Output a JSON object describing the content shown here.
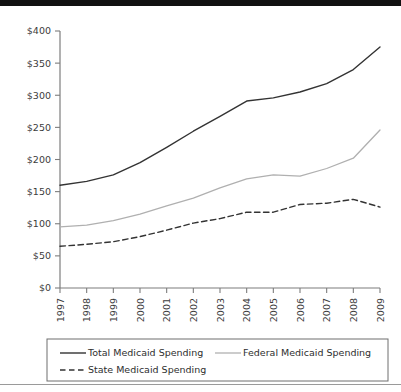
{
  "page": {
    "top_band_color": "#111111",
    "background_color": "#ffffff",
    "rule_color": "#9a9a9a"
  },
  "chart_data": {
    "type": "line",
    "title": "",
    "subtitle": "",
    "xlabel": "",
    "ylabel": "",
    "categories": [
      "1997",
      "1998",
      "1999",
      "2000",
      "2001",
      "2002",
      "2003",
      "2004",
      "2005",
      "2006",
      "2007",
      "2008",
      "2009"
    ],
    "x": [
      1997,
      1998,
      1999,
      2000,
      2001,
      2002,
      2003,
      2004,
      2005,
      2006,
      2007,
      2008,
      2009
    ],
    "ylim": [
      0,
      400
    ],
    "xlim": [
      1997,
      2009
    ],
    "y_tick_values": [
      0,
      50,
      100,
      150,
      200,
      250,
      300,
      350,
      400
    ],
    "y_tick_labels": [
      "$0",
      "$50",
      "$100",
      "$150",
      "$200",
      "$250",
      "$300",
      "$350",
      "$400"
    ],
    "x_tick_labels": [
      "1997",
      "1998",
      "1999",
      "2000",
      "2001",
      "2002",
      "2003",
      "2004",
      "2005",
      "2006",
      "2007",
      "2008",
      "2009"
    ],
    "grid": false,
    "legend_position": "bottom",
    "units": "billions of dollars",
    "series": [
      {
        "name": "Total Medicaid Spending",
        "color": "#333333",
        "style": "solid",
        "width": 1.4,
        "values": [
          160,
          166,
          176,
          195,
          219,
          244,
          267,
          291,
          296,
          305,
          318,
          340,
          375
        ]
      },
      {
        "name": "Federal Medicaid Spending",
        "color": "#b0b0b0",
        "style": "solid",
        "width": 1.3,
        "values": [
          95,
          98,
          105,
          115,
          128,
          140,
          156,
          170,
          176,
          174,
          186,
          202,
          246
        ]
      },
      {
        "name": "State Medicaid Spending",
        "color": "#333333",
        "style": "dashed",
        "width": 1.4,
        "values": [
          65,
          68,
          72,
          80,
          90,
          101,
          108,
          118,
          118,
          130,
          132,
          138,
          126
        ]
      }
    ]
  },
  "legend": {
    "entries": [
      {
        "label": "Total Medicaid Spending",
        "swatch": "solid-dark-line-swatch"
      },
      {
        "label": "Federal Medicaid Spending",
        "swatch": "solid-light-line-swatch"
      },
      {
        "label": "State Medicaid Spending",
        "swatch": "dashed-dark-line-swatch"
      }
    ],
    "border_color": "#6e6e6e"
  },
  "axis": {
    "axis_color": "#7d7d7d",
    "tick_color": "#7d7d7d",
    "label_color": "#3c3c3c"
  }
}
